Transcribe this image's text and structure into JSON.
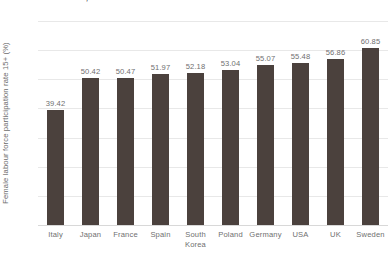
{
  "chart_data": {
    "type": "bar",
    "title": "...selected countries, 2019",
    "xlabel": "",
    "ylabel": "Female labour force participation rate 15+ (%)",
    "ylim": [
      0,
      70
    ],
    "yticks": [
      0,
      10,
      20,
      30,
      40,
      50,
      60,
      70
    ],
    "grid": true,
    "legend": false,
    "bar_color": "#4b413d",
    "gridline_color": "#e8e8e8",
    "categories": [
      "Italy",
      "Japan",
      "France",
      "Spain",
      "South Korea",
      "Poland",
      "Germany",
      "USA",
      "UK",
      "Sweden"
    ],
    "category_lines": [
      [
        "Italy"
      ],
      [
        "Japan"
      ],
      [
        "France"
      ],
      [
        "Spain"
      ],
      [
        "South",
        "Korea"
      ],
      [
        "Poland"
      ],
      [
        "Germany"
      ],
      [
        "USA"
      ],
      [
        "UK"
      ],
      [
        "Sweden"
      ]
    ],
    "values": [
      39.42,
      50.42,
      50.47,
      51.97,
      52.18,
      53.04,
      55.07,
      55.48,
      56.86,
      60.85
    ],
    "value_labels": [
      "39.42",
      "50.42",
      "50.47",
      "51.97",
      "52.18",
      "53.04",
      "55.07",
      "55.48",
      "56.86",
      "60.85"
    ],
    "ytick_labels": [
      "0",
      "10",
      "20",
      "30",
      "40",
      "50",
      "60",
      "70"
    ]
  }
}
